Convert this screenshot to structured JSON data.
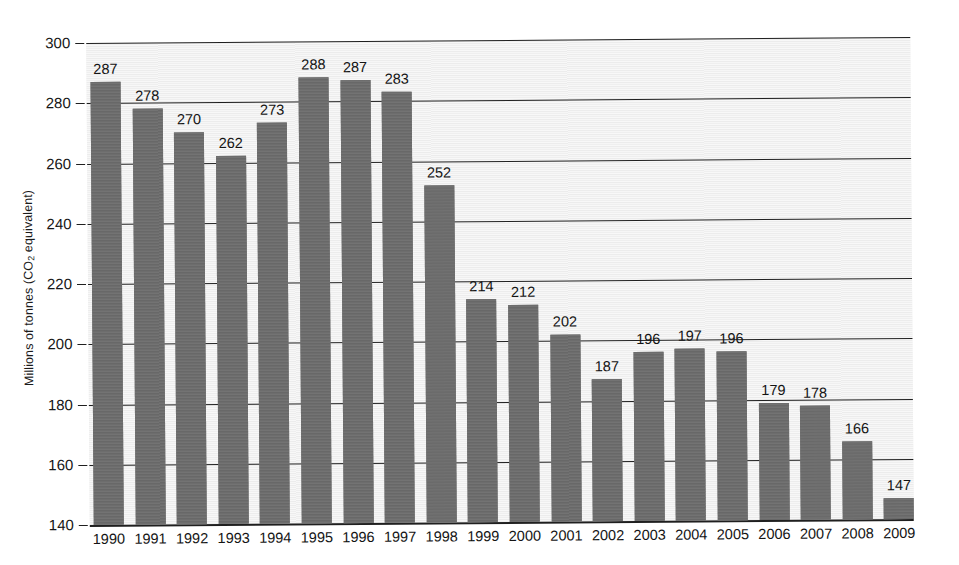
{
  "chart_data": {
    "type": "bar",
    "title": "",
    "xlabel": "",
    "ylabel": "Millions of tonnes (CO2 equivalent)",
    "ylabel_parts": {
      "prefix": "Millions of tonnes (CO",
      "subscript": "2",
      "suffix": " equivalent)"
    },
    "ylim": [
      140,
      300
    ],
    "yticks": [
      140,
      160,
      180,
      200,
      220,
      240,
      260,
      280,
      300
    ],
    "grid": true,
    "legend": "none",
    "bar_color": "#6f6f6f",
    "plot_background": "#f3f3f3",
    "axis_color": "#1f1f1f",
    "categories": [
      "1990",
      "1991",
      "1992",
      "1993",
      "1994",
      "1995",
      "1996",
      "1997",
      "1998",
      "1999",
      "2000",
      "2001",
      "2002",
      "2003",
      "2004",
      "2005",
      "2006",
      "2007",
      "2008",
      "2009"
    ],
    "values": [
      287,
      278,
      270,
      262,
      273,
      288,
      287,
      283,
      252,
      214,
      212,
      202,
      187,
      196,
      197,
      196,
      179,
      178,
      166,
      147
    ],
    "value_labels": [
      "287",
      "278",
      "270",
      "262",
      "273",
      "288",
      "287",
      "283",
      "252",
      "214",
      "212",
      "202",
      "187",
      "196",
      "197",
      "196",
      "179",
      "178",
      "166",
      "147"
    ]
  }
}
